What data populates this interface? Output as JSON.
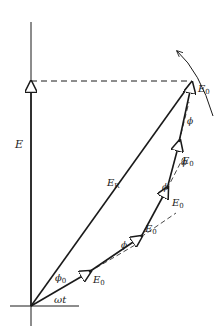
{
  "diagram": {
    "type": "phasor diagram",
    "labels": {
      "vertical_axis": "E",
      "resultant": "E",
      "resultant_sub": "R",
      "initial_angle": "ϕ",
      "initial_angle_sub": "0",
      "angle_wt": "ωt",
      "phasor": "E",
      "phasor_sub": "0",
      "phase_step": "ϕ"
    },
    "phasor_count": 5,
    "rotation_direction": "counterclockwise",
    "colors": {
      "line": "#1a1a1a",
      "background": "#ffffff"
    }
  }
}
